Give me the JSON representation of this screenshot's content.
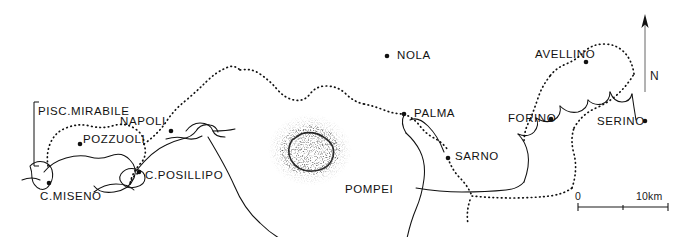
{
  "map": {
    "title": "Bay of Naples and the Aqua Augusta aqueduct",
    "background_color": "#ffffff",
    "ink_color": "#111111",
    "width": 698,
    "height": 237,
    "places": [
      {
        "id": "pisc-mirabile",
        "label": "PISC.MIRABILE",
        "x": 38,
        "y": 112,
        "label_x": 38,
        "label_y": 106,
        "has_dot": false,
        "dot_x": 0,
        "dot_y": 0
      },
      {
        "id": "napoli",
        "label": "NAPOLI",
        "x": 163,
        "y": 122,
        "label_x": 120,
        "label_y": 116,
        "has_dot": true,
        "dot_x": 171,
        "dot_y": 131
      },
      {
        "id": "pozzuoli",
        "label": "POZZUOLI",
        "x": 85,
        "y": 139,
        "label_x": 83,
        "label_y": 134,
        "has_dot": true,
        "dot_x": 80,
        "dot_y": 144
      },
      {
        "id": "c-posillipo",
        "label": "C.POSILLIPO",
        "x": 145,
        "y": 174,
        "label_x": 145,
        "label_y": 170,
        "has_dot": true,
        "dot_x": 139,
        "dot_y": 172
      },
      {
        "id": "c-miseno",
        "label": "C.MISENO",
        "x": 40,
        "y": 194,
        "label_x": 40,
        "label_y": 191,
        "has_dot": true,
        "dot_x": 49,
        "dot_y": 183
      },
      {
        "id": "nola",
        "label": "NOLA",
        "x": 397,
        "y": 55,
        "label_x": 397,
        "label_y": 50,
        "has_dot": true,
        "dot_x": 387,
        "dot_y": 56
      },
      {
        "id": "palma",
        "label": "PALMA",
        "x": 414,
        "y": 113,
        "label_x": 414,
        "label_y": 108,
        "has_dot": true,
        "dot_x": 404,
        "dot_y": 114
      },
      {
        "id": "sarno",
        "label": "SARNO",
        "x": 455,
        "y": 155,
        "label_x": 455,
        "label_y": 151,
        "has_dot": true,
        "dot_x": 448,
        "dot_y": 158
      },
      {
        "id": "pompei",
        "label": "POMPEI",
        "x": 345,
        "y": 188,
        "label_x": 345,
        "label_y": 184,
        "has_dot": false,
        "dot_x": 0,
        "dot_y": 0
      },
      {
        "id": "avellino",
        "label": "AVELLINO",
        "x": 535,
        "y": 55,
        "label_x": 535,
        "label_y": 49,
        "has_dot": true,
        "dot_x": 586,
        "dot_y": 62
      },
      {
        "id": "forino",
        "label": "FORINO",
        "x": 508,
        "y": 118,
        "label_x": 508,
        "label_y": 113,
        "has_dot": true,
        "dot_x": 551,
        "dot_y": 119
      },
      {
        "id": "serino",
        "label": "SERINO",
        "x": 597,
        "y": 120,
        "label_x": 597,
        "label_y": 116,
        "has_dot": true,
        "dot_x": 645,
        "dot_y": 121
      }
    ],
    "scale_bar": {
      "start_label": "0",
      "end_label": "10km",
      "start_x": 578,
      "end_x": 668,
      "y": 207,
      "tick_mid_x": 623
    },
    "north_arrow": {
      "label": "N",
      "tip_x": 645,
      "tip_y": 16,
      "base_y": 92,
      "label_x": 650,
      "label_y": 70
    },
    "bracket": {
      "x": 34,
      "top_y": 102,
      "bottom_y": 166,
      "tick_len": 5
    },
    "legend_lines": {
      "aqueduct_style": "dotted",
      "coastline_style": "solid"
    }
  }
}
